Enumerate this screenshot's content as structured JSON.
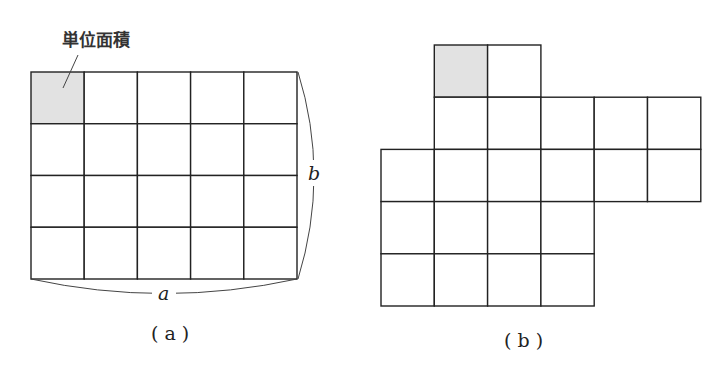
{
  "figure_a": {
    "caption": "( a )",
    "callout_label": "単位面積",
    "width_label": "a",
    "height_label": "b",
    "columns": 5,
    "rows": 4,
    "shaded_cells": [
      [
        0,
        0
      ]
    ]
  },
  "figure_b": {
    "caption": "( b )",
    "rows": [
      {
        "start_col": 1,
        "count": 2
      },
      {
        "start_col": 1,
        "count": 5
      },
      {
        "start_col": 0,
        "count": 6
      },
      {
        "start_col": 0,
        "count": 4
      },
      {
        "start_col": 0,
        "count": 4
      }
    ],
    "shaded_cells": [
      [
        0,
        1
      ]
    ]
  },
  "colors": {
    "shaded": "#e2e2e2",
    "line": "#222222"
  }
}
